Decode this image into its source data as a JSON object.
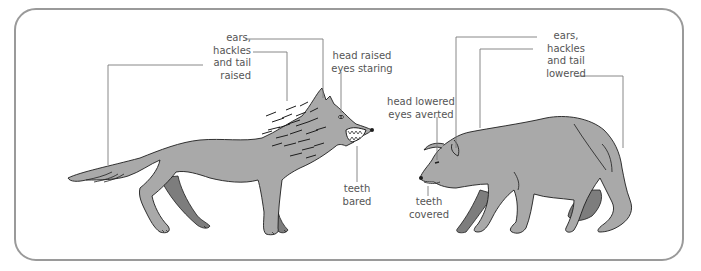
{
  "figure": {
    "colors": {
      "frame_border": "#9a9a9a",
      "leader_line": "#7a7a7a",
      "label_text": "#555555",
      "body_fill": "#a9a9a9",
      "far_leg_fill": "#7d7d7d",
      "outline": "#1e1e1e"
    }
  },
  "dominant_wolf": {
    "labels": {
      "posture": "ears,\nhackles\nand tail\nraised",
      "head": "head raised\neyes staring",
      "teeth": "teeth\nbared"
    }
  },
  "submissive_wolf": {
    "labels": {
      "posture": "ears,\nhackles\nand tail\nlowered",
      "head": "head lowered\neyes averted",
      "teeth": "teeth\ncovered"
    }
  }
}
